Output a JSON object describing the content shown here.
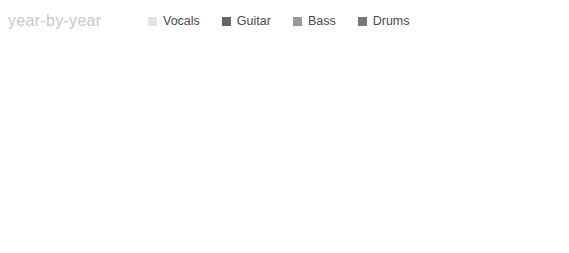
{
  "title": "year-by-year",
  "legend": {
    "position": "top",
    "items": [
      {
        "label": "Vocals",
        "color": "#e3e3e3"
      },
      {
        "label": "Guitar",
        "color": "#666666"
      },
      {
        "label": "Bass",
        "color": "#999999"
      },
      {
        "label": "Drums",
        "color": "#777777"
      }
    ]
  },
  "axis": {
    "xlabel": "",
    "ylabel": "",
    "xlim": [
      1987,
      2012
    ],
    "ticks": [
      1990,
      1995,
      2000,
      2005,
      2010
    ],
    "tick_labels": [
      "1990",
      "1995",
      "2000",
      "2005",
      "2010"
    ],
    "minor_step": 1,
    "grid": true
  },
  "labels": {
    "labels_band": "label",
    "albums_band": "album"
  },
  "chart_data": {
    "type": "bar",
    "orientation": "horizontal",
    "title": "year-by-year",
    "xlabel": "",
    "ylabel": "",
    "xlim": [
      1987,
      2012
    ],
    "grid": true,
    "legend_position": "top",
    "categories": [
      "Fallon",
      "Bach",
      "Sabo",
      "Hill",
      "Bolan",
      "Affuso",
      "Solinger"
    ],
    "series": [
      {
        "name": "Vocals",
        "color": "#e3e3e3",
        "bars": [
          {
            "category": "Fallon",
            "start": 1987,
            "end": 1988.0
          },
          {
            "category": "Bach",
            "start": 1988.0,
            "end": 1999.0
          },
          {
            "category": "Solinger",
            "start": 1999.5,
            "end": 2012
          }
        ]
      },
      {
        "name": "Guitar",
        "color": "#666666",
        "bars": [
          {
            "category": "Sabo",
            "start": 1987,
            "end": 2012
          },
          {
            "category": "Hill",
            "start": 1988.0,
            "end": 2012
          }
        ]
      },
      {
        "name": "Bass",
        "color": "#999999",
        "bars": [
          {
            "category": "Bolan",
            "start": 1987,
            "end": 2012
          }
        ]
      },
      {
        "name": "Drums",
        "color": "#777777",
        "bars": [
          {
            "category": "Affuso",
            "start": 1988.0,
            "end": 1997.8
          }
        ]
      }
    ],
    "labels": {
      "albums": [
        {
          "name": "atlantic",
          "start": 1988.1,
          "end": 1996.3,
          "color": "#dcdcdc"
        },
        {
          "name": "skid row",
          "start": 2002.0,
          "end": 2004.0,
          "color": "#dcdcdc"
        },
        {
          "name": "steamhammer",
          "start": 2004.5,
          "end": 2007.5,
          "color": "#dcdcdc"
        }
      ],
      "releases": [
        {
          "name": "Skid Row",
          "year": 1989.0
        },
        {
          "name": "Slave to the Grind",
          "year": 1991.0
        },
        {
          "name": "Subhuman Race",
          "year": 1995.0
        },
        {
          "name": "Thickskin",
          "year": 2003.0
        },
        {
          "name": "Revolutions Per Minute",
          "year": 2006.0
        }
      ]
    }
  }
}
